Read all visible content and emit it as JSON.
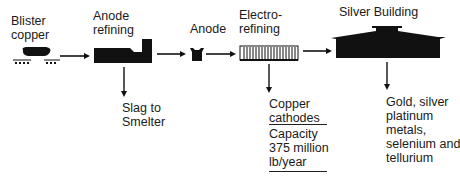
{
  "diagram": {
    "stages": [
      {
        "id": "blister",
        "label_lines": [
          "Blister",
          "copper"
        ]
      },
      {
        "id": "anode-refining",
        "label_lines": [
          "Anode",
          "refining"
        ]
      },
      {
        "id": "anode",
        "label_lines": [
          "Anode"
        ]
      },
      {
        "id": "electrorefining",
        "label_lines": [
          "Electro-",
          "refining"
        ]
      },
      {
        "id": "silver-building",
        "label_lines": [
          "Silver Building"
        ]
      }
    ],
    "outputs": {
      "slag": {
        "lines": [
          "Slag to",
          "Smelter"
        ]
      },
      "copper": {
        "lines": [
          "Copper",
          "cathodes"
        ]
      },
      "capacity": {
        "lines": [
          "Capacity",
          "375 million",
          "lb/year"
        ]
      },
      "precious": {
        "lines": [
          "Gold, silver",
          "platinum",
          "metals,",
          "selenium and",
          "tellurium"
        ]
      }
    },
    "colors": {
      "ink": "#111111",
      "background": "#ffffff"
    }
  }
}
